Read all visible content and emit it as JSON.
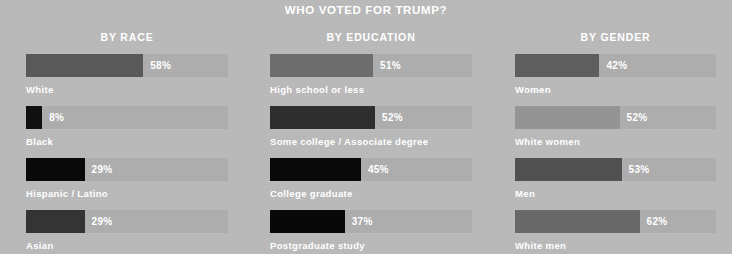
{
  "title": "WHO VOTED FOR TRUMP?",
  "background_color": "#b9b9b9",
  "track_color": "#adadad",
  "text_color": "#ffffff",
  "chart_data": {
    "type": "bar",
    "title": "WHO VOTED FOR TRUMP?",
    "xlabel": "",
    "ylabel": "",
    "xlim": [
      0,
      100
    ],
    "grid": false,
    "legend": "none",
    "orientation": "horizontal",
    "value_suffix": "%",
    "panels": [
      {
        "title": "BY RACE",
        "categories": [
          "White",
          "Black",
          "Hispanic / Latino",
          "Asian"
        ],
        "values": [
          58,
          8,
          29,
          29
        ],
        "value_labels": [
          "58%",
          "8%",
          "29%",
          "29%"
        ],
        "bar_colors": [
          "#595959",
          "#111111",
          "#090909",
          "#343434"
        ]
      },
      {
        "title": "BY EDUCATION",
        "categories": [
          "High school or less",
          "Some college / Associate degree",
          "College graduate",
          "Postgraduate study"
        ],
        "values": [
          51,
          52,
          45,
          37
        ],
        "value_labels": [
          "51%",
          "52%",
          "45%",
          "37%"
        ],
        "bar_colors": [
          "#6d6d6d",
          "#2e2e2e",
          "#090909",
          "#080808"
        ]
      },
      {
        "title": "BY GENDER",
        "categories": [
          "Women",
          "White women",
          "Men",
          "White men"
        ],
        "values": [
          42,
          52,
          53,
          62
        ],
        "value_labels": [
          "42%",
          "52%",
          "53%",
          "62%"
        ],
        "bar_colors": [
          "#5e5e5e",
          "#949494",
          "#515151",
          "#686868"
        ]
      }
    ]
  }
}
